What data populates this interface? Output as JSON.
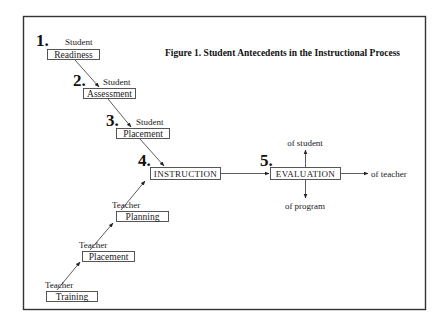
{
  "figure": {
    "title": "Figure 1.  Student Antecedents in the Instructional Process"
  },
  "steps": [
    {
      "number": "1.",
      "label": "Student",
      "box": "Readiness"
    },
    {
      "number": "2.",
      "label": "Student",
      "box": "Assessment"
    },
    {
      "number": "3.",
      "label": "Student",
      "box": "Placement"
    },
    {
      "number": "4.",
      "box": "INSTRUCTION"
    },
    {
      "number": "5.",
      "box": "EVALUATION"
    }
  ],
  "teacher_chain": [
    {
      "label": "Teacher",
      "box": "Training"
    },
    {
      "label": "Teacher",
      "box": "Placement"
    },
    {
      "label": "Teacher",
      "box": "Planning"
    }
  ],
  "evaluation_targets": {
    "up": "of student",
    "right": "of teacher",
    "down": "of program"
  },
  "colors": {
    "line": "#333333",
    "background": "#ffffff"
  }
}
